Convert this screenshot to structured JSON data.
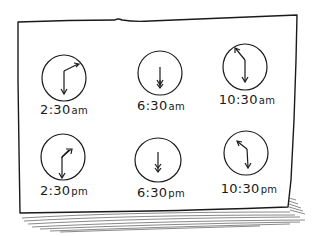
{
  "board": {
    "ink_color": "#1a1a1a",
    "background": "#ffffff"
  },
  "clocks": [
    {
      "time": "2:30",
      "suffix": "am",
      "hour_hand": "2",
      "minute_hand": "30",
      "cx": 64,
      "cy": 78,
      "label_x": 64,
      "label_y": 104
    },
    {
      "time": "6:30",
      "suffix": "am",
      "hour_hand": "6",
      "minute_hand": "30",
      "cx": 160,
      "cy": 73,
      "label_x": 161,
      "label_y": 100
    },
    {
      "time": "10:30",
      "suffix": "am",
      "hour_hand": "10",
      "minute_hand": "30",
      "cx": 245,
      "cy": 67,
      "label_x": 247,
      "label_y": 94
    },
    {
      "time": "2:30",
      "suffix": "pm",
      "hour_hand": "2",
      "minute_hand": "30",
      "cx": 63,
      "cy": 157,
      "label_x": 64,
      "label_y": 185
    },
    {
      "time": "6:30",
      "suffix": "pm",
      "hour_hand": "6",
      "minute_hand": "30",
      "cx": 158,
      "cy": 160,
      "label_x": 161,
      "label_y": 187
    },
    {
      "time": "10:30",
      "suffix": "pm",
      "hour_hand": "10",
      "minute_hand": "30",
      "cx": 246,
      "cy": 153,
      "label_x": 249,
      "label_y": 183
    }
  ]
}
